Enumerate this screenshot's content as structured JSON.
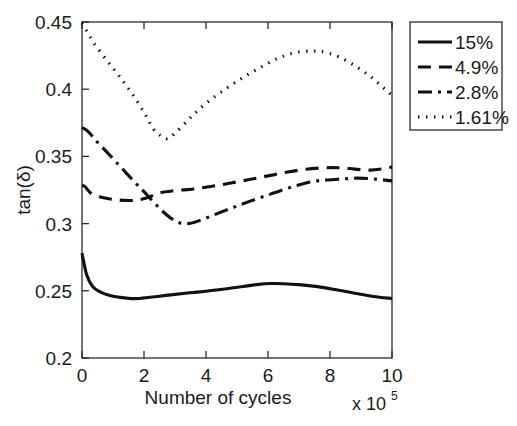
{
  "chart_data": {
    "type": "line",
    "title": "",
    "xlabel": "Number of cycles",
    "ylabel": "tan(δ)",
    "x_multiplier": "x 10",
    "x_multiplier_exp": "5",
    "xlim": [
      0,
      10
    ],
    "ylim": [
      0.2,
      0.45
    ],
    "xticks": [
      0,
      2,
      4,
      6,
      8,
      10
    ],
    "xtick_labels": [
      "0",
      "2",
      "4",
      "6",
      "8",
      "10"
    ],
    "yticks": [
      0.2,
      0.25,
      0.3,
      0.35,
      0.4,
      0.45
    ],
    "ytick_labels": [
      "0.2",
      "0.25",
      "0.3",
      "0.35",
      "0.4",
      "0.45"
    ],
    "grid": false,
    "legend_position": "outside-top-right",
    "series": [
      {
        "name": "15%",
        "style": "solid",
        "dasharray": "",
        "x": [
          0.0,
          0.15,
          0.35,
          0.6,
          0.9,
          1.2,
          1.7,
          2.2,
          2.8,
          3.4,
          4.0,
          4.6,
          5.2,
          5.7,
          6.1,
          6.5,
          7.0,
          7.6,
          8.2,
          8.8,
          9.4,
          10.0
        ],
        "y": [
          0.278,
          0.262,
          0.253,
          0.249,
          0.2465,
          0.2452,
          0.2442,
          0.2452,
          0.2468,
          0.2483,
          0.2497,
          0.2513,
          0.2532,
          0.2548,
          0.2554,
          0.2553,
          0.2546,
          0.2531,
          0.2508,
          0.2482,
          0.2458,
          0.2443
        ]
      },
      {
        "name": "4.9%",
        "style": "dashed",
        "dasharray": "13,8",
        "x": [
          0.0,
          0.1,
          0.3,
          0.7,
          1.2,
          1.7,
          2.1,
          2.5,
          3.0,
          3.6,
          4.2,
          4.8,
          5.4,
          6.0,
          6.6,
          7.2,
          7.8,
          8.3,
          8.8,
          9.3,
          9.7,
          10.0
        ],
        "y": [
          0.3285,
          0.3275,
          0.3225,
          0.3192,
          0.3175,
          0.3173,
          0.3192,
          0.3228,
          0.3245,
          0.3258,
          0.3278,
          0.3302,
          0.3328,
          0.3355,
          0.3382,
          0.3404,
          0.3415,
          0.3415,
          0.3405,
          0.3398,
          0.3408,
          0.3422
        ]
      },
      {
        "name": "2.8%",
        "style": "dashdot",
        "dasharray": "14,6,3,6",
        "x": [
          0.0,
          0.2,
          0.5,
          0.9,
          1.3,
          1.7,
          2.0,
          2.3,
          2.6,
          2.9,
          3.2,
          3.5,
          3.9,
          4.4,
          4.9,
          5.4,
          5.9,
          6.4,
          6.9,
          7.4,
          7.9,
          8.4,
          8.9,
          9.4,
          10.0
        ],
        "y": [
          0.3715,
          0.3685,
          0.3605,
          0.3508,
          0.3408,
          0.3308,
          0.3238,
          0.3162,
          0.3092,
          0.3035,
          0.3002,
          0.3002,
          0.3032,
          0.3078,
          0.3122,
          0.3165,
          0.3205,
          0.3245,
          0.3282,
          0.3312,
          0.3325,
          0.3332,
          0.3338,
          0.3332,
          0.3318
        ]
      },
      {
        "name": "1.61%",
        "style": "dotted",
        "dasharray": "1.5,6.5",
        "x": [
          0.0,
          0.15,
          0.4,
          0.8,
          1.2,
          1.6,
          2.0,
          2.3,
          2.55,
          2.75,
          3.0,
          3.4,
          3.8,
          4.3,
          4.8,
          5.3,
          5.8,
          6.3,
          6.8,
          7.2,
          7.55,
          7.9,
          8.3,
          8.8,
          9.3,
          9.7,
          10.0
        ],
        "y": [
          0.4492,
          0.4435,
          0.4338,
          0.4215,
          0.4098,
          0.3972,
          0.3828,
          0.3705,
          0.3652,
          0.3632,
          0.3672,
          0.3765,
          0.3855,
          0.3948,
          0.4028,
          0.4102,
          0.4168,
          0.4228,
          0.4268,
          0.4282,
          0.4284,
          0.4272,
          0.4238,
          0.4175,
          0.4095,
          0.4015,
          0.3952
        ]
      }
    ]
  },
  "legend": {
    "items": [
      {
        "label": "15%"
      },
      {
        "label": "4.9%"
      },
      {
        "label": "2.8%"
      },
      {
        "label": "1.61%"
      }
    ]
  }
}
